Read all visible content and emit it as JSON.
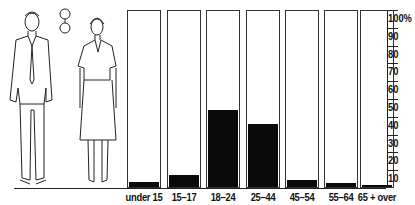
{
  "chart_data": {
    "type": "bar",
    "title": "",
    "xlabel": "",
    "ylabel": "",
    "ylim": [
      0,
      100
    ],
    "categories": [
      "under 15",
      "15–17",
      "18–24",
      "25–44",
      "45–54",
      "55–64",
      "65 + over"
    ],
    "values": [
      3,
      7,
      44,
      36,
      4,
      2,
      1
    ],
    "y_ticks": [
      "10",
      "20",
      "30",
      "40",
      "50",
      "60",
      "70",
      "80",
      "90",
      "100%"
    ],
    "grid": false,
    "illustration": "man and woman figures with interlocked rings symbol"
  }
}
